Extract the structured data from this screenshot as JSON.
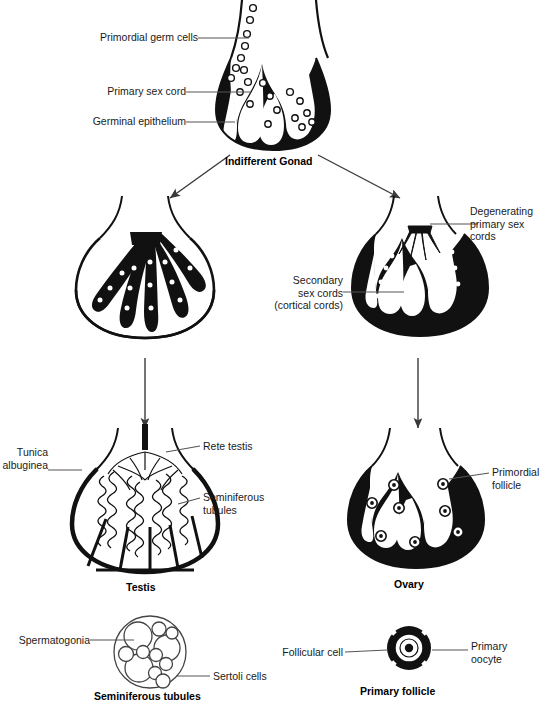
{
  "diagram": {
    "ink_color": "#111111",
    "leader_color": "#555555",
    "background": "#ffffff"
  },
  "stages": {
    "indifferent": {
      "caption": "Indifferent Gonad",
      "labels": {
        "germ_cells": "Primordial germ cells",
        "primary_sex_cord": "Primary sex cord",
        "germinal_epithelium": "Germinal epithelium"
      }
    },
    "male_intermediate": {
      "caption": ""
    },
    "female_intermediate": {
      "caption": "",
      "labels": {
        "degenerating": "Degenerating\nprimary sex\ncords",
        "secondary": "Secondary\nsex cords\n(cortical cords)"
      }
    },
    "testis": {
      "caption": "Testis",
      "labels": {
        "tunica": "Tunica\nalbuginea",
        "rete": "Rete testis",
        "tubules": "Seminiferous\ntubules"
      }
    },
    "ovary": {
      "caption": "Ovary",
      "labels": {
        "follicle": "Primordial\nfollicle"
      }
    },
    "seminiferous_inset": {
      "caption": "Seminiferous tubules",
      "labels": {
        "spermatogonia": "Spermatogonia",
        "sertoli": "Sertoli cells"
      }
    },
    "follicle_inset": {
      "caption": "Primary follicle",
      "labels": {
        "follicular_cell": "Follicular cell",
        "primary_oocyte": "Primary\noocyte"
      }
    }
  }
}
